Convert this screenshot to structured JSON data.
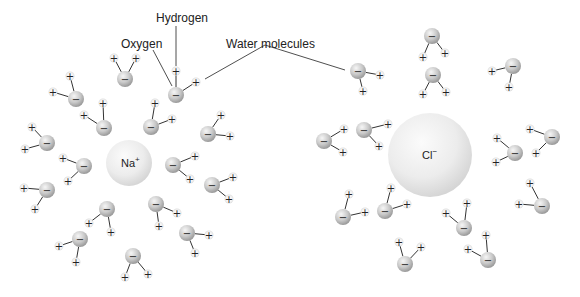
{
  "labels": {
    "hydrogen": "Hydrogen",
    "oxygen": "Oxygen",
    "water_molecules": "Water molecules"
  },
  "ions": [
    {
      "id": "sodium",
      "symbol": "Na",
      "charge": "+"
    },
    {
      "id": "chloride",
      "symbol": "Cl",
      "charge": "−"
    }
  ],
  "glyphs": {
    "oxygen_charge": "−",
    "hydrogen_charge": "+"
  },
  "colors": {
    "ion_light": "#f4f4f4",
    "ion_dark": "#cfcfcf",
    "oxygen_light": "#f2f2f2",
    "oxygen_dark": "#9a9a9a",
    "bond": "#333333",
    "leader": "#222222"
  },
  "water_counts": {
    "around_sodium": 16,
    "around_chloride": 14
  }
}
